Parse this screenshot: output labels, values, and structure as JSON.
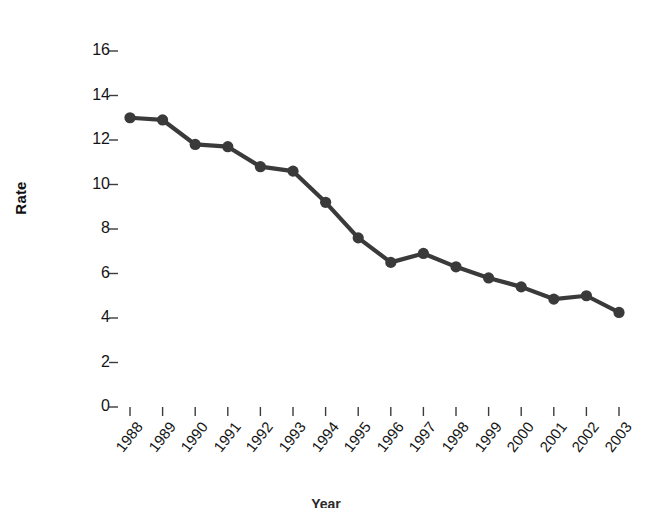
{
  "chart_data": {
    "type": "line",
    "title": "",
    "xlabel": "Year",
    "ylabel": "Rate",
    "categories": [
      "1988",
      "1989",
      "1990",
      "1991",
      "1992",
      "1993",
      "1994",
      "1995",
      "1996",
      "1997",
      "1998",
      "1999",
      "2000",
      "2001",
      "2002",
      "2003"
    ],
    "values": [
      13.0,
      12.9,
      11.8,
      11.7,
      10.8,
      10.6,
      9.2,
      7.6,
      6.5,
      6.9,
      6.3,
      5.8,
      5.4,
      4.85,
      5.0,
      4.25
    ],
    "series": [
      {
        "name": "Rate",
        "values": [
          13.0,
          12.9,
          11.8,
          11.7,
          10.8,
          10.6,
          9.2,
          7.6,
          6.5,
          6.9,
          6.3,
          5.8,
          5.4,
          4.85,
          5.0,
          4.25
        ]
      }
    ],
    "ylim": [
      0,
      17.6
    ],
    "yticks": [
      0,
      2,
      4,
      6,
      8,
      10,
      12,
      14,
      16
    ],
    "ytick_labels": [
      "0",
      "2",
      "4",
      "6",
      "8",
      "10",
      "12",
      "14",
      "16"
    ],
    "xtick_labels": [
      "1988",
      "1989",
      "1990",
      "1991",
      "1992",
      "1993",
      "1994",
      "1995",
      "1996",
      "1997",
      "1998",
      "1999",
      "2000",
      "2001",
      "2002",
      "2003"
    ],
    "grid": false,
    "legend": null,
    "legend_position": "none",
    "marker": "circle",
    "line_color": "#3a3a3a",
    "marker_color": "#3a3a3a",
    "frame_color": "#3c3c3c",
    "background": "#ffffff",
    "annotations": []
  },
  "axes": {
    "y_title": "Rate",
    "x_title": "Year"
  },
  "title_text": ""
}
